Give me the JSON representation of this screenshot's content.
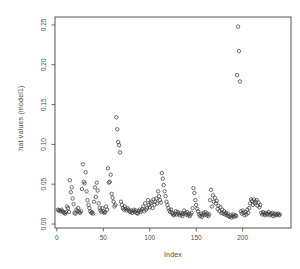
{
  "figure": {
    "background": "#ffffff",
    "axis_color": "#555555",
    "text_color": "#4a4a4a",
    "point_color": "#3c3c3c"
  },
  "chart_data": {
    "type": "scatter",
    "title": "",
    "xlabel": "Index",
    "ylabel": "hat values (model1)",
    "marker": "open-circle",
    "grid": false,
    "legend": null,
    "xlim": [
      -2,
      252
    ],
    "ylim": [
      -0.005,
      0.26
    ],
    "xticks": [
      0,
      50,
      100,
      150,
      200
    ],
    "yticks": [
      0,
      0.05,
      0.1,
      0.15,
      0.2,
      0.25
    ],
    "ytick_labels": [
      "0.00",
      "0.05",
      "0.10",
      "0.15",
      "0.20",
      "0.25"
    ],
    "points": [
      [
        1,
        0.018
      ],
      [
        2,
        0.017
      ],
      [
        3,
        0.017
      ],
      [
        4,
        0.016
      ],
      [
        5,
        0.018
      ],
      [
        6,
        0.016
      ],
      [
        7,
        0.015
      ],
      [
        8,
        0.014
      ],
      [
        9,
        0.013
      ],
      [
        10,
        0.015
      ],
      [
        11,
        0.022
      ],
      [
        12,
        0.02
      ],
      [
        13,
        0.015
      ],
      [
        14,
        0.055
      ],
      [
        15,
        0.04
      ],
      [
        16,
        0.046
      ],
      [
        17,
        0.032
      ],
      [
        18,
        0.025
      ],
      [
        19,
        0.014
      ],
      [
        20,
        0.013
      ],
      [
        21,
        0.018
      ],
      [
        22,
        0.016
      ],
      [
        23,
        0.02
      ],
      [
        24,
        0.015
      ],
      [
        25,
        0.014
      ],
      [
        26,
        0.016
      ],
      [
        27,
        0.044
      ],
      [
        28,
        0.075
      ],
      [
        29,
        0.053
      ],
      [
        30,
        0.051
      ],
      [
        31,
        0.065
      ],
      [
        32,
        0.041
      ],
      [
        33,
        0.03
      ],
      [
        34,
        0.024
      ],
      [
        35,
        0.02
      ],
      [
        36,
        0.016
      ],
      [
        37,
        0.014
      ],
      [
        38,
        0.015
      ],
      [
        39,
        0.013
      ],
      [
        40,
        0.028
      ],
      [
        41,
        0.046
      ],
      [
        42,
        0.034
      ],
      [
        43,
        0.052
      ],
      [
        44,
        0.042
      ],
      [
        45,
        0.026
      ],
      [
        46,
        0.02
      ],
      [
        47,
        0.017
      ],
      [
        48,
        0.015
      ],
      [
        49,
        0.02
      ],
      [
        50,
        0.016
      ],
      [
        51,
        0.014
      ],
      [
        52,
        0.015
      ],
      [
        53,
        0.022
      ],
      [
        54,
        0.018
      ],
      [
        55,
        0.07
      ],
      [
        56,
        0.052
      ],
      [
        57,
        0.053
      ],
      [
        58,
        0.062
      ],
      [
        59,
        0.038
      ],
      [
        60,
        0.033
      ],
      [
        61,
        0.028
      ],
      [
        62,
        0.022
      ],
      [
        63,
        0.024
      ],
      [
        64,
        0.134
      ],
      [
        65,
        0.119
      ],
      [
        66,
        0.103
      ],
      [
        67,
        0.099
      ],
      [
        68,
        0.09
      ],
      [
        69,
        0.028
      ],
      [
        70,
        0.024
      ],
      [
        71,
        0.02
      ],
      [
        72,
        0.018
      ],
      [
        73,
        0.022
      ],
      [
        74,
        0.019
      ],
      [
        75,
        0.017
      ],
      [
        76,
        0.02
      ],
      [
        77,
        0.018
      ],
      [
        78,
        0.016
      ],
      [
        79,
        0.015
      ],
      [
        80,
        0.017
      ],
      [
        81,
        0.014
      ],
      [
        82,
        0.016
      ],
      [
        83,
        0.018
      ],
      [
        84,
        0.015
      ],
      [
        85,
        0.017
      ],
      [
        86,
        0.014
      ],
      [
        87,
        0.013
      ],
      [
        88,
        0.016
      ],
      [
        89,
        0.018
      ],
      [
        90,
        0.015
      ],
      [
        91,
        0.017
      ],
      [
        92,
        0.019
      ],
      [
        93,
        0.022
      ],
      [
        94,
        0.016
      ],
      [
        95,
        0.026
      ],
      [
        96,
        0.018
      ],
      [
        97,
        0.02
      ],
      [
        98,
        0.03
      ],
      [
        99,
        0.024
      ],
      [
        100,
        0.021
      ],
      [
        101,
        0.026
      ],
      [
        102,
        0.028
      ],
      [
        103,
        0.02
      ],
      [
        104,
        0.031
      ],
      [
        105,
        0.024
      ],
      [
        106,
        0.028
      ],
      [
        107,
        0.032
      ],
      [
        108,
        0.026
      ],
      [
        109,
        0.041
      ],
      [
        110,
        0.035
      ],
      [
        111,
        0.03
      ],
      [
        112,
        0.027
      ],
      [
        113,
        0.064
      ],
      [
        114,
        0.057
      ],
      [
        115,
        0.049
      ],
      [
        116,
        0.041
      ],
      [
        117,
        0.035
      ],
      [
        118,
        0.028
      ],
      [
        119,
        0.024
      ],
      [
        120,
        0.02
      ],
      [
        121,
        0.017
      ],
      [
        122,
        0.015
      ],
      [
        123,
        0.018
      ],
      [
        124,
        0.014
      ],
      [
        125,
        0.012
      ],
      [
        126,
        0.011
      ],
      [
        127,
        0.013
      ],
      [
        128,
        0.016
      ],
      [
        129,
        0.012
      ],
      [
        130,
        0.015
      ],
      [
        131,
        0.013
      ],
      [
        132,
        0.011
      ],
      [
        133,
        0.014
      ],
      [
        134,
        0.012
      ],
      [
        135,
        0.01
      ],
      [
        136,
        0.013
      ],
      [
        137,
        0.017
      ],
      [
        138,
        0.014
      ],
      [
        139,
        0.012
      ],
      [
        140,
        0.015
      ],
      [
        141,
        0.011
      ],
      [
        142,
        0.013
      ],
      [
        143,
        0.01
      ],
      [
        144,
        0.012
      ],
      [
        145,
        0.014
      ],
      [
        146,
        0.02
      ],
      [
        147,
        0.045
      ],
      [
        148,
        0.039
      ],
      [
        149,
        0.03
      ],
      [
        150,
        0.024
      ],
      [
        151,
        0.019
      ],
      [
        152,
        0.016
      ],
      [
        153,
        0.012
      ],
      [
        154,
        0.01
      ],
      [
        155,
        0.013
      ],
      [
        156,
        0.009
      ],
      [
        157,
        0.011
      ],
      [
        158,
        0.014
      ],
      [
        159,
        0.012
      ],
      [
        160,
        0.015
      ],
      [
        161,
        0.011
      ],
      [
        162,
        0.013
      ],
      [
        163,
        0.01
      ],
      [
        164,
        0.012
      ],
      [
        165,
        0.03
      ],
      [
        166,
        0.043
      ],
      [
        167,
        0.022
      ],
      [
        168,
        0.036
      ],
      [
        169,
        0.028
      ],
      [
        170,
        0.033
      ],
      [
        171,
        0.026
      ],
      [
        172,
        0.029
      ],
      [
        173,
        0.019
      ],
      [
        174,
        0.023
      ],
      [
        175,
        0.016
      ],
      [
        176,
        0.021
      ],
      [
        177,
        0.014
      ],
      [
        178,
        0.018
      ],
      [
        179,
        0.013
      ],
      [
        180,
        0.016
      ],
      [
        181,
        0.012
      ],
      [
        182,
        0.014
      ],
      [
        183,
        0.011
      ],
      [
        184,
        0.013
      ],
      [
        185,
        0.01
      ],
      [
        186,
        0.009
      ],
      [
        187,
        0.011
      ],
      [
        188,
        0.008
      ],
      [
        189,
        0.01
      ],
      [
        190,
        0.012
      ],
      [
        191,
        0.009
      ],
      [
        192,
        0.011
      ],
      [
        193,
        0.01
      ],
      [
        194,
        0.187
      ],
      [
        195,
        0.248
      ],
      [
        196,
        0.217
      ],
      [
        197,
        0.179
      ],
      [
        198,
        0.016
      ],
      [
        199,
        0.013
      ],
      [
        200,
        0.017
      ],
      [
        201,
        0.014
      ],
      [
        202,
        0.011
      ],
      [
        203,
        0.015
      ],
      [
        204,
        0.012
      ],
      [
        205,
        0.018
      ],
      [
        206,
        0.014
      ],
      [
        207,
        0.02
      ],
      [
        208,
        0.026
      ],
      [
        209,
        0.031
      ],
      [
        210,
        0.029
      ],
      [
        211,
        0.024
      ],
      [
        212,
        0.031
      ],
      [
        213,
        0.026
      ],
      [
        214,
        0.028
      ],
      [
        215,
        0.03
      ],
      [
        216,
        0.023
      ],
      [
        217,
        0.027
      ],
      [
        218,
        0.021
      ],
      [
        219,
        0.024
      ],
      [
        220,
        0.014
      ],
      [
        221,
        0.012
      ],
      [
        222,
        0.015
      ],
      [
        223,
        0.013
      ],
      [
        224,
        0.011
      ],
      [
        225,
        0.014
      ],
      [
        226,
        0.012
      ],
      [
        227,
        0.013
      ],
      [
        228,
        0.015
      ],
      [
        229,
        0.011
      ],
      [
        230,
        0.013
      ],
      [
        231,
        0.012
      ],
      [
        232,
        0.014
      ],
      [
        233,
        0.01
      ],
      [
        234,
        0.012
      ],
      [
        235,
        0.013
      ],
      [
        236,
        0.011
      ],
      [
        237,
        0.012
      ],
      [
        238,
        0.013
      ],
      [
        239,
        0.011
      ],
      [
        240,
        0.012
      ]
    ]
  }
}
